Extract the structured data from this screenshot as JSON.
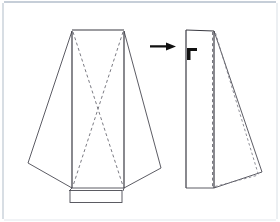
{
  "figure": {
    "background_color": "#ffffff",
    "border_color": "#c3ccd6",
    "line_color": "#4a4a52",
    "dashed_color": "#6b6b74",
    "arrow_color": "#111111",
    "width": 280,
    "height": 222
  },
  "left_figure": {
    "name": "unfolded-flared-panel",
    "body_outline": "72,30 124,30 124,188 72,188",
    "left_flare": "72,31 28,163 72,188",
    "right_flare": "124,31 161,168 124,188",
    "crease_diagonal_1": "72,31 124,186",
    "crease_diagonal_2": "124,31 72,186",
    "base_rect": {
      "x": 70,
      "y": 190,
      "width": 52,
      "height": 12
    },
    "base_left_tab": "72,188 70,190",
    "base_right_tab": "124,188 122,190"
  },
  "right_figure": {
    "name": "folded-flared-panel",
    "body_outline": "186,30 214,31 214,188 186,188",
    "right_flare": "214,31 262,172 214,188",
    "fold_crease_vertical": "213,32 213,187",
    "fold_crease_diagonal": "215,32 258,175",
    "fold_crease_bottom": "214,187 258,175",
    "corner_mark": {
      "x": 187,
      "y": 48,
      "width": 10,
      "height": 12
    }
  },
  "arrow": {
    "name": "transformation-arrow",
    "x1": 150,
    "y1": 46,
    "x2": 176,
    "y2": 46,
    "direction": "right"
  }
}
